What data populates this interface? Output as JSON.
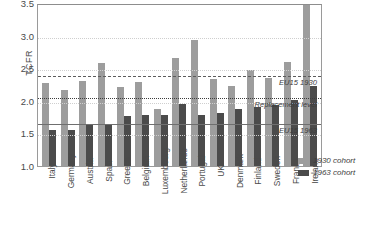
{
  "chart_data": {
    "type": "bar",
    "title": "",
    "xlabel": "",
    "ylabel": "TCFR",
    "ylim": [
      1.0,
      3.5
    ],
    "yticks": [
      1.0,
      1.5,
      2.0,
      2.5,
      3.0,
      3.5
    ],
    "ytick_labels": [
      "1.0",
      "1.5",
      "2.0",
      "2.5",
      "3.0",
      "3.5"
    ],
    "grid": true,
    "legend_position": "right",
    "categories": [
      "Italy",
      "Germany",
      "Austria",
      "Spain",
      "Greece",
      "Belgium",
      "Luxembourg",
      "Netherlands",
      "Portugal",
      "UK",
      "Denmark",
      "Finland",
      "Sweden",
      "France",
      "Ireland"
    ],
    "series": [
      {
        "name": "1930 cohort",
        "color": "#9d9d9d",
        "values": [
          2.28,
          2.17,
          2.31,
          2.58,
          2.21,
          2.29,
          1.87,
          2.65,
          2.93,
          2.33,
          2.22,
          2.47,
          2.35,
          2.6,
          3.95
        ]
      },
      {
        "name": "1963 cohort",
        "color": "#4b4b4b",
        "values": [
          1.55,
          1.56,
          1.64,
          1.64,
          1.77,
          1.79,
          1.79,
          1.95,
          1.79,
          1.82,
          1.88,
          1.9,
          1.94,
          2.01,
          2.23
        ]
      }
    ],
    "reference_lines": [
      {
        "label": "EU15 1930",
        "value": 2.41,
        "style": "dashed"
      },
      {
        "label": "Replacement level",
        "value": 2.08,
        "style": "dotted"
      },
      {
        "label": "EU15 1963",
        "value": 1.68,
        "style": "solid"
      }
    ]
  },
  "legend": {
    "items": [
      {
        "label": "1930 cohort",
        "color": "#9d9d9d"
      },
      {
        "label": "1963 cohort",
        "color": "#4b4b4b"
      }
    ]
  }
}
